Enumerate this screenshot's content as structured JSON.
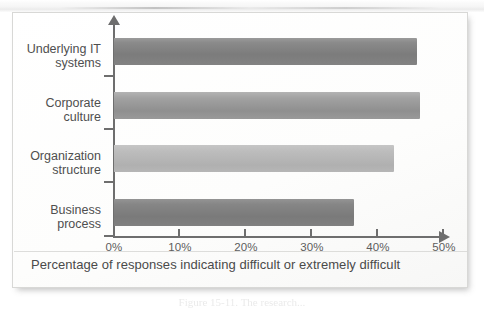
{
  "figure": {
    "frame_border_color": "#d8d8d6",
    "axis_color": "#6e6e6e",
    "caption_inside": "Percentage of responses indicating difficult or extremely difficult",
    "caption_below": "Figure 15-11. The research..."
  },
  "axis_icons": {
    "y_arrow": "arrow-up-icon",
    "x_arrow": "arrow-right-icon"
  },
  "chart_data": {
    "type": "bar",
    "orientation": "horizontal",
    "title": "",
    "subtitle": "",
    "xlabel": "Percentage of responses indicating difficult or extremely difficult",
    "ylabel": "",
    "categories": [
      "Underlying IT\nsystems",
      "Corporate\nculture",
      "Organization\nstructure",
      "Business\nprocess"
    ],
    "values": [
      46,
      46.5,
      42.5,
      36.5
    ],
    "value_labels": [
      "46%",
      "46.5%",
      "42.5%",
      "36.5%"
    ],
    "xlim": [
      0,
      50
    ],
    "xticks": [
      0,
      10,
      20,
      30,
      40,
      50
    ],
    "xticklabels": [
      "0%",
      "10%",
      "20%",
      "30%",
      "40%",
      "50%"
    ],
    "grid": false,
    "legend": false,
    "bar_colors": [
      "#7f7f7f",
      "#969696",
      "#b8b8b8",
      "#7d7d7d"
    ]
  }
}
